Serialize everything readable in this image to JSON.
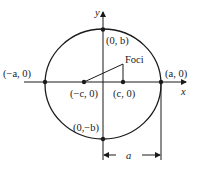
{
  "diagram": {
    "type": "ellipse-with-foci",
    "axes": {
      "x_label": "x",
      "y_label": "y"
    },
    "points": {
      "left_vertex": "(−a, 0)",
      "right_vertex": "(a, 0)",
      "top_covertex": "(0, b)",
      "bottom_covertex": "(0,−b)",
      "left_focus": "(−c, 0)",
      "right_focus": "(c, 0)"
    },
    "foci_label": "Foci",
    "dimension_label": "a",
    "colors": {
      "stroke": "#1a1a1a",
      "background": "#ffffff"
    }
  }
}
